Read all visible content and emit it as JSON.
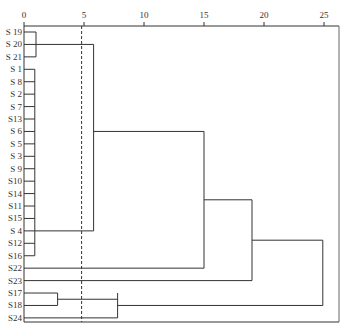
{
  "chart_data": {
    "type": "dendrogram",
    "title": "",
    "xlabel": "",
    "ylabel": "",
    "x_axis": {
      "position": "top",
      "ticks": [
        0,
        5,
        10,
        15,
        20,
        25
      ],
      "tick_labels": [
        "0",
        "5",
        "10",
        "15",
        "20",
        "25"
      ],
      "range": [
        0,
        26.3
      ]
    },
    "threshold_line": {
      "value": 4.8,
      "style": "dashed"
    },
    "leaves": [
      "S 19",
      "S 20",
      "S 21",
      "S 1",
      "S 8",
      "S 2",
      "S 7",
      "S13",
      "S 6",
      "S 5",
      "S 3",
      "S 9",
      "S10",
      "S14",
      "S11",
      "S15",
      "S 4",
      "S12",
      "S16",
      "S22",
      "S23",
      "S17",
      "S18",
      "S24"
    ],
    "merges": [
      {
        "members": [
          "S 19",
          "S 20",
          "S 21"
        ],
        "distance": 1.0
      },
      {
        "members": [
          "S 1",
          "S 8",
          "S 2",
          "S 7",
          "S13",
          "S 6",
          "S 5",
          "S 3",
          "S 9",
          "S10",
          "S14",
          "S11",
          "S15",
          "S 4",
          "S12",
          "S16"
        ],
        "distance": 0.9
      },
      {
        "members": [
          "S 17",
          "S18"
        ],
        "distance": 2.8
      },
      {
        "members": [
          "cluster(S19-S21)",
          "cluster(S1-S16)"
        ],
        "distance": 5.8
      },
      {
        "members": [
          "cluster(S17,S18)",
          "S24"
        ],
        "distance": 7.8
      },
      {
        "members": [
          "cluster(S19-S16)",
          "S22"
        ],
        "distance": 15.0
      },
      {
        "members": [
          "cluster(S19-S22)",
          "S23"
        ],
        "distance": 19.0
      },
      {
        "members": [
          "cluster(S19-S23)",
          "cluster(S17,S18,S24)"
        ],
        "distance": 24.9
      }
    ],
    "grid": false,
    "legend": null
  },
  "figure": {
    "caption_visible": "cropped / illegible"
  }
}
